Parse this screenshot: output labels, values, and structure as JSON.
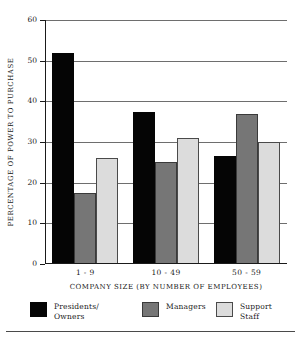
{
  "chart_data": {
    "type": "bar",
    "title": "",
    "xlabel": "COMPANY SIZE (BY NUMBER OF EMPLOYEES)",
    "ylabel": "PERCENTAGE OF POWER TO PURCHASE",
    "categories": [
      "1 - 9",
      "10 - 49",
      "50 - 59"
    ],
    "series": [
      {
        "name": "Presidents/\nOwners",
        "color": "#050505",
        "values": [
          52,
          37.5,
          26.5
        ]
      },
      {
        "name": "Managers",
        "color": "#767676",
        "values": [
          17.5,
          25,
          37
        ]
      },
      {
        "name": "Support Staff",
        "color": "#dcdcdc",
        "values": [
          26,
          31,
          30
        ]
      }
    ],
    "ylim": [
      0,
      60
    ],
    "yticks": [
      0,
      10,
      20,
      30,
      40,
      50,
      60
    ],
    "ytick_labels": [
      "0",
      "10",
      "20",
      "30",
      "40",
      "50",
      "60"
    ],
    "grid": true,
    "legend_position": "bottom"
  }
}
